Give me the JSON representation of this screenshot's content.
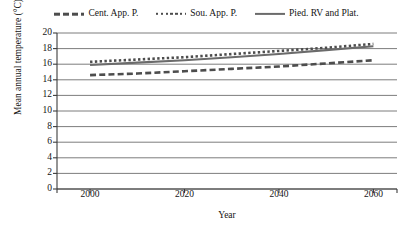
{
  "chart_data": {
    "type": "line",
    "title": "",
    "xlabel": "Year",
    "ylabel": "Mean annual temperature (°C)",
    "xlim": [
      1993,
      2065
    ],
    "ylim": [
      0,
      20
    ],
    "ytick_values": [
      0,
      2,
      4,
      6,
      8,
      10,
      12,
      14,
      16,
      18,
      20
    ],
    "ytick_labels": [
      "0",
      "2",
      "4",
      "6",
      "8",
      "10",
      "12",
      "14",
      "16",
      "18",
      "20"
    ],
    "xtick_values": [
      2000,
      2020,
      2040,
      2060
    ],
    "xtick_labels": [
      "2000",
      "2020",
      "2040",
      "2060"
    ],
    "grid": "horizontal",
    "legend_position": "top",
    "x": [
      2000,
      2010,
      2020,
      2030,
      2040,
      2050,
      2060
    ],
    "series": [
      {
        "name": "Cent. App. P.",
        "style": "dashed",
        "color": "#4d4d4d",
        "values": [
          14.6,
          14.8,
          15.1,
          15.4,
          15.7,
          16.1,
          16.5
        ]
      },
      {
        "name": "Sou. App. P.",
        "style": "dotted",
        "color": "#4d4d4d",
        "values": [
          16.3,
          16.6,
          16.9,
          17.3,
          17.7,
          18.1,
          18.6
        ]
      },
      {
        "name": "Pied. RV and Plat.",
        "style": "solid",
        "color": "#6b6b6b",
        "values": [
          15.9,
          16.2,
          16.5,
          16.9,
          17.3,
          17.8,
          18.3
        ]
      }
    ]
  },
  "legend": {
    "items": [
      {
        "label": "Cent. App. P.",
        "swatch": "dashed-line-swatch"
      },
      {
        "label": "Sou. App. P.",
        "swatch": "dotted-line-swatch"
      },
      {
        "label": "Pied. RV and Plat.",
        "swatch": "solid-line-swatch"
      }
    ]
  },
  "axes": {
    "y_title": "Mean annual temperature (°C)",
    "x_title": "Year"
  }
}
